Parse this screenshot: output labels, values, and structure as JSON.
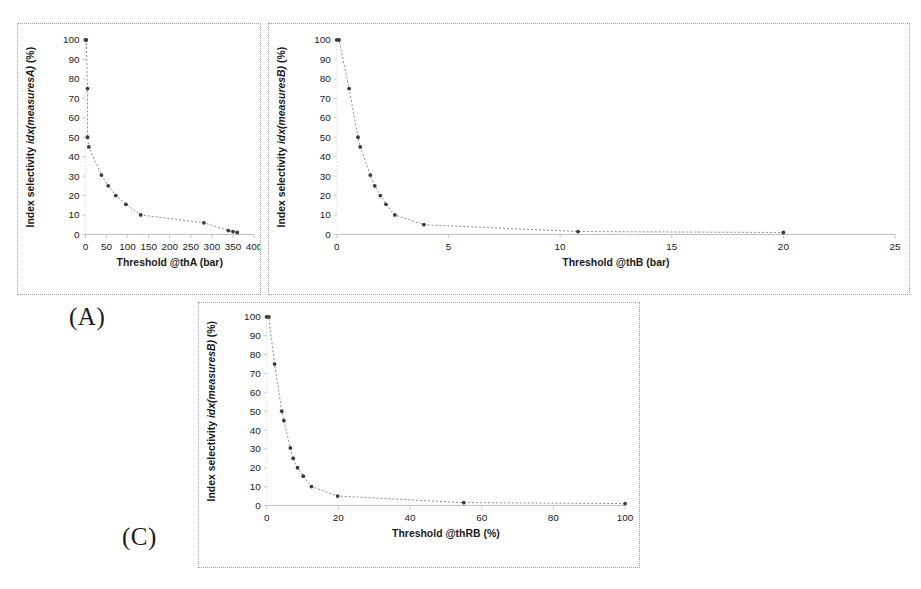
{
  "figure": {
    "background": "#ffffff",
    "panel_border_color": "#9aa0a6",
    "marker_color": "#3a3a3a",
    "curve_color": "#8a8a8a"
  },
  "labels": {
    "panel_a": "(A)",
    "panel_c": "(C)"
  },
  "chart_data": [
    {
      "id": "A",
      "type": "line",
      "title": "",
      "xlabel": "Threshold  @thA (bar)",
      "xlabel_prefix": "Threshold  @thA (bar)",
      "ylabel": "Index selectivity idx(measuresA) (%)",
      "ylabel_plain": "Index selectivity ",
      "ylabel_italic": "idx(measuresA)",
      "ylabel_suffix": " (%)",
      "xlim": [
        0,
        400
      ],
      "ylim": [
        0,
        100
      ],
      "xticks": [
        0,
        50,
        100,
        150,
        200,
        250,
        300,
        350,
        400
      ],
      "yticks": [
        0,
        10,
        20,
        30,
        40,
        50,
        60,
        70,
        80,
        90,
        100
      ],
      "grid": false,
      "legend": "none",
      "x": [
        0,
        2,
        5,
        8,
        38,
        54,
        72,
        96,
        131,
        281,
        339,
        350,
        360
      ],
      "y": [
        100,
        100,
        75,
        45,
        30.5,
        25,
        20,
        15.5,
        10,
        6,
        2,
        1.5,
        1
      ],
      "points": [
        {
          "x": 0,
          "y": 100
        },
        {
          "x": 2,
          "y": 100
        },
        {
          "x": 5,
          "y": 75
        },
        {
          "x": 5,
          "y": 50
        },
        {
          "x": 8,
          "y": 45
        },
        {
          "x": 38,
          "y": 30.5
        },
        {
          "x": 54,
          "y": 25
        },
        {
          "x": 72,
          "y": 20
        },
        {
          "x": 96,
          "y": 15.5
        },
        {
          "x": 131,
          "y": 10
        },
        {
          "x": 281,
          "y": 6
        },
        {
          "x": 339,
          "y": 2
        },
        {
          "x": 350,
          "y": 1.5
        },
        {
          "x": 360,
          "y": 1
        }
      ]
    },
    {
      "id": "B",
      "type": "line",
      "title": "",
      "xlabel": "Threshold  @thB (bar)",
      "xlabel_prefix": "Threshold  @thB (bar)",
      "ylabel": "Index selectivity idx(measuresB) (%)",
      "ylabel_plain": "Index selectivity ",
      "ylabel_italic": "idx(measuresB)",
      "ylabel_suffix": " (%)",
      "xlim": [
        0,
        25
      ],
      "ylim": [
        0,
        100
      ],
      "xticks": [
        0,
        5,
        10,
        15,
        20,
        25
      ],
      "yticks": [
        0,
        10,
        20,
        30,
        40,
        50,
        60,
        70,
        80,
        90,
        100
      ],
      "grid": false,
      "legend": "none",
      "points": [
        {
          "x": 0,
          "y": 100
        },
        {
          "x": 0.1,
          "y": 100
        },
        {
          "x": 0.55,
          "y": 75
        },
        {
          "x": 0.95,
          "y": 50
        },
        {
          "x": 1.05,
          "y": 45
        },
        {
          "x": 1.5,
          "y": 30.5
        },
        {
          "x": 1.7,
          "y": 25
        },
        {
          "x": 1.95,
          "y": 20
        },
        {
          "x": 2.2,
          "y": 15.5
        },
        {
          "x": 2.6,
          "y": 10
        },
        {
          "x": 3.9,
          "y": 5
        },
        {
          "x": 10.8,
          "y": 1.5
        },
        {
          "x": 20,
          "y": 1
        }
      ]
    },
    {
      "id": "C",
      "type": "line",
      "title": "",
      "xlabel": "Threshold  @thRB (%)",
      "xlabel_prefix": "Threshold  @thRB (%)",
      "ylabel": "Index selectivity idx(measuresB) (%)",
      "ylabel_plain": "Index selectivity ",
      "ylabel_italic": "idx(measuresB)",
      "ylabel_suffix": " (%)",
      "xlim": [
        0,
        100
      ],
      "ylim": [
        0,
        100
      ],
      "xticks": [
        0,
        20,
        40,
        60,
        80,
        100
      ],
      "yticks": [
        0,
        10,
        20,
        30,
        40,
        50,
        60,
        70,
        80,
        90,
        100
      ],
      "grid": false,
      "legend": "none",
      "points": [
        {
          "x": 0,
          "y": 100
        },
        {
          "x": 0.6,
          "y": 100
        },
        {
          "x": 2.2,
          "y": 75
        },
        {
          "x": 4.2,
          "y": 50
        },
        {
          "x": 4.8,
          "y": 45
        },
        {
          "x": 6.6,
          "y": 30.5
        },
        {
          "x": 7.4,
          "y": 25
        },
        {
          "x": 8.6,
          "y": 20
        },
        {
          "x": 10.2,
          "y": 15.5
        },
        {
          "x": 12.5,
          "y": 10
        },
        {
          "x": 19.8,
          "y": 5
        },
        {
          "x": 55,
          "y": 1.5
        },
        {
          "x": 100,
          "y": 1
        }
      ]
    }
  ]
}
